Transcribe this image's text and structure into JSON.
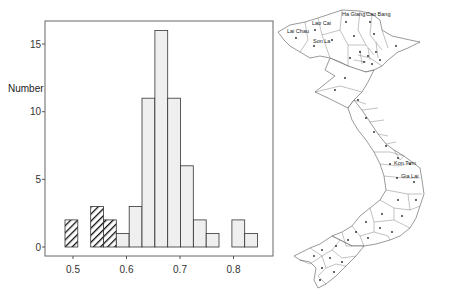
{
  "chart_data": [
    {
      "type": "bar",
      "title": "",
      "xlabel": "",
      "ylabel": "Number",
      "xlim": [
        0.46,
        0.86
      ],
      "ylim": [
        0,
        16.8
      ],
      "grid": false,
      "bin_width": 0.024,
      "x_ticks": [
        0.5,
        0.6,
        0.7,
        0.8
      ],
      "x_tick_labels": [
        "0.5",
        "0.6",
        "0.7",
        "0.8"
      ],
      "y_ticks": [
        0,
        5,
        10,
        15
      ],
      "y_tick_labels": [
        "0",
        "5",
        "10",
        "15"
      ],
      "bin_starts": [
        0.485,
        0.509,
        0.533,
        0.557,
        0.581,
        0.605,
        0.629,
        0.653,
        0.677,
        0.701,
        0.725,
        0.749,
        0.773,
        0.797,
        0.821
      ],
      "series": [
        {
          "name": "hatched",
          "pattern": "diagonal-hatch",
          "values": [
            2,
            0,
            3,
            2,
            0,
            0,
            0,
            0,
            0,
            0,
            0,
            0,
            0,
            0,
            0
          ]
        },
        {
          "name": "light",
          "fill": "#efefef",
          "values": [
            0,
            0,
            0,
            0,
            1,
            3,
            11,
            16,
            11,
            6,
            2,
            1,
            0,
            2,
            1
          ]
        }
      ]
    }
  ],
  "histogram": {
    "ylabel": "Number",
    "colors": {
      "bar_fill": "#efefef",
      "bar_stroke": "#333333",
      "hatch": "#111111",
      "axis": "#555555"
    }
  },
  "map": {
    "title": "",
    "labels": [
      {
        "name": "Ha Giang",
        "x": 72,
        "y": 16
      },
      {
        "name": "Cao Bang",
        "x": 96,
        "y": 16
      },
      {
        "name": "Lai Chau",
        "x": 17,
        "y": 33
      },
      {
        "name": "Lao Cai",
        "x": 42,
        "y": 25
      },
      {
        "name": "Son La",
        "x": 43,
        "y": 43
      },
      {
        "name": "Kon Tum",
        "x": 124,
        "y": 165
      },
      {
        "name": "Gia Lai",
        "x": 131,
        "y": 178
      }
    ]
  }
}
